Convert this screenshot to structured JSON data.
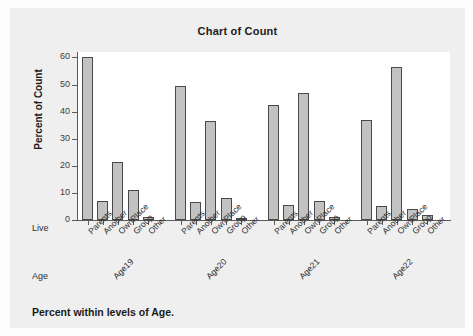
{
  "chart_data": {
    "type": "bar",
    "title": "Chart of Count",
    "xlabel": "",
    "ylabel": "Percent of Count",
    "ylim": [
      0,
      62
    ],
    "yticks": [
      0,
      10,
      20,
      30,
      40,
      50,
      60
    ],
    "grid": false,
    "legend": "none",
    "bar_color": "#c2c2c2",
    "bar_edge_color": "#4a4a4a",
    "footnote": "Percent within levels of Age.",
    "outer_row_label": "Age",
    "inner_row_label": "Live",
    "categories": [
      "Parents",
      "Another",
      "OwnPlace",
      "Group",
      "Other"
    ],
    "groups": [
      "Age19",
      "Age20",
      "Age21",
      "Age22"
    ],
    "series": [
      {
        "name": "Age19",
        "values": [
          60.0,
          7.0,
          21.5,
          11.0,
          1.0
        ]
      },
      {
        "name": "Age20",
        "values": [
          49.5,
          6.5,
          36.5,
          8.0,
          0.5
        ]
      },
      {
        "name": "Age21",
        "values": [
          42.5,
          5.5,
          47.0,
          7.0,
          1.0
        ]
      },
      {
        "name": "Age22",
        "values": [
          37.0,
          5.0,
          56.5,
          4.0,
          2.0
        ]
      }
    ]
  }
}
